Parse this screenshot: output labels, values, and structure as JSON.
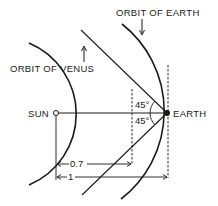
{
  "labels": {
    "orbit_earth": "ORBIT OF EARTH",
    "orbit_venus": "ORBIT OF VENUS",
    "sun": "SUN",
    "earth": "EARTH",
    "angle_upper": "45°",
    "angle_lower": "45°",
    "dist_venus": "0.7",
    "dist_earth": "1"
  },
  "geometry": {
    "sun": [
      56,
      113
    ],
    "earth": [
      167,
      113
    ],
    "venus_orbit_radius_relative": 0.7,
    "earth_orbit_radius_relative": 1,
    "elongation_angle_deg": 45
  },
  "colors": {
    "ink": "#1a1a1a",
    "background": "#ffffff"
  }
}
